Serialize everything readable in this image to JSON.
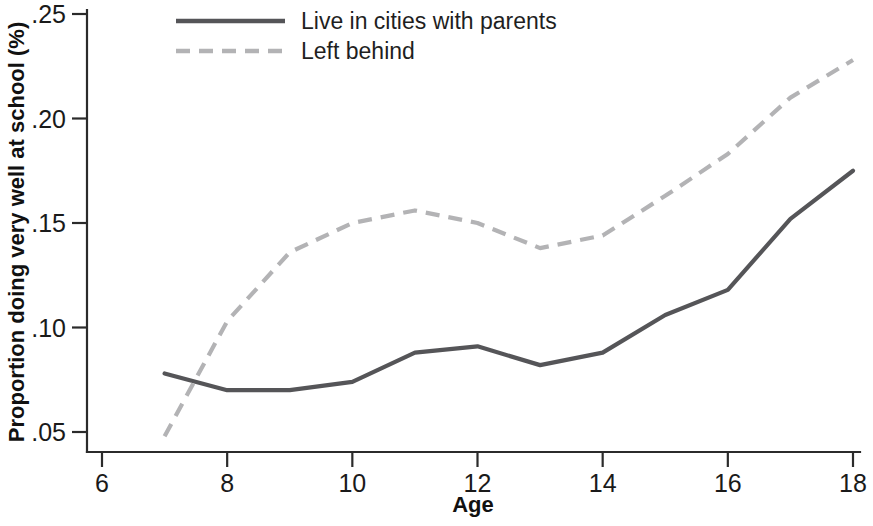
{
  "chart_data": {
    "type": "line",
    "title": "",
    "xlabel": "Age",
    "ylabel": "Proportion doing very well at school (%)",
    "x": [
      7,
      8,
      9,
      10,
      11,
      12,
      13,
      14,
      15,
      16,
      17,
      18
    ],
    "xlim": [
      6,
      18
    ],
    "ylim": [
      0.05,
      0.25
    ],
    "xticks": [
      6,
      8,
      10,
      12,
      14,
      16,
      18
    ],
    "xticklabels": [
      "6",
      "8",
      "10",
      "12",
      "14",
      "16",
      "18"
    ],
    "yticks": [
      0.05,
      0.1,
      0.15,
      0.2,
      0.25
    ],
    "yticklabels": [
      ".05",
      ".10",
      ".15",
      ".20",
      ".25"
    ],
    "grid": false,
    "legend_position": "top-center",
    "series": [
      {
        "name": "Live in cities with parents",
        "style": "solid",
        "color": "#555558",
        "values": [
          0.078,
          0.07,
          0.07,
          0.074,
          0.088,
          0.091,
          0.082,
          0.088,
          0.106,
          0.118,
          0.152,
          0.175
        ]
      },
      {
        "name": "Left behind",
        "style": "dashed",
        "color": "#b3b3b5",
        "values": [
          0.048,
          0.103,
          0.136,
          0.15,
          0.156,
          0.15,
          0.138,
          0.144,
          0.163,
          0.183,
          0.21,
          0.228
        ]
      }
    ]
  },
  "legend": {
    "entries": [
      {
        "label": "Live in cities with parents",
        "style": "solid"
      },
      {
        "label": "Left behind",
        "style": "dashed"
      }
    ]
  }
}
